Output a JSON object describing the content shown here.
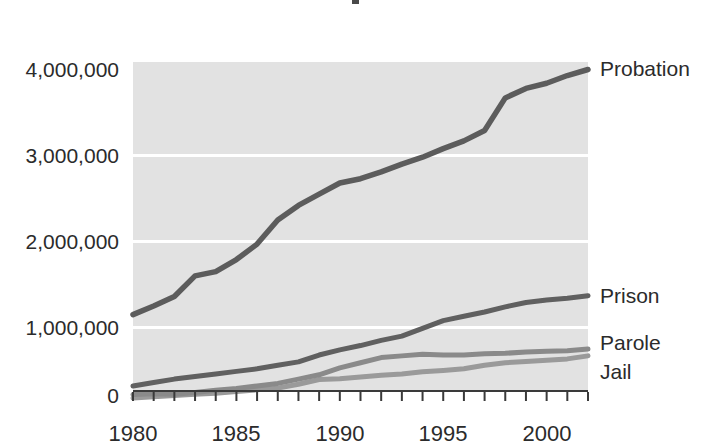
{
  "chart_data": {
    "type": "line",
    "title": "",
    "subtitle": "",
    "xlabel": "",
    "ylabel": "",
    "xlim": [
      1980,
      2002
    ],
    "ylim": [
      0,
      4200000
    ],
    "grid": true,
    "legend_position": "right-of-lines",
    "y_tick_labels": [
      "4,000,000",
      "3,000,000",
      "2,000,000",
      "1,000,000",
      "0"
    ],
    "y_tick_values": [
      4000000,
      3000000,
      2000000,
      1000000,
      0
    ],
    "x_tick_labels": [
      "1980",
      "1985",
      "1990",
      "1995",
      "2000"
    ],
    "x_tick_values": [
      1980,
      1985,
      1990,
      1995,
      2000
    ],
    "x_minor_ticks": [
      1980,
      1981,
      1982,
      1983,
      1984,
      1985,
      1986,
      1987,
      1988,
      1989,
      1990,
      1991,
      1992,
      1993,
      1994,
      1995,
      1996,
      1997,
      1998,
      1999,
      2000,
      2001,
      2002
    ],
    "x": [
      1980,
      1981,
      1982,
      1983,
      1984,
      1985,
      1986,
      1987,
      1988,
      1989,
      1990,
      1991,
      1992,
      1993,
      1994,
      1995,
      1996,
      1997,
      1998,
      1999,
      2000,
      2001,
      2002
    ],
    "series": [
      {
        "name": "Probation",
        "label": "Probation",
        "color": "#5c5c5c",
        "values": [
          1150000,
          1250000,
          1360000,
          1600000,
          1650000,
          1790000,
          1970000,
          2250000,
          2420000,
          2550000,
          2680000,
          2730000,
          2810000,
          2900000,
          2980000,
          3080000,
          3170000,
          3290000,
          3670000,
          3780000,
          3840000,
          3930000,
          4000000
        ]
      },
      {
        "name": "Prison",
        "label": "Prison",
        "color": "#606060",
        "values": [
          320000,
          360000,
          400000,
          430000,
          460000,
          490000,
          520000,
          560000,
          600000,
          680000,
          740000,
          790000,
          850000,
          900000,
          990000,
          1080000,
          1130000,
          1180000,
          1240000,
          1290000,
          1320000,
          1340000,
          1370000
        ]
      },
      {
        "name": "Parole",
        "label": "Parole",
        "color": "#8a8a8a",
        "values": [
          220000,
          230000,
          225000,
          245000,
          270000,
          290000,
          320000,
          350000,
          400000,
          450000,
          530000,
          590000,
          650000,
          670000,
          690000,
          680000,
          680000,
          695000,
          700000,
          715000,
          725000,
          730000,
          750000
        ]
      },
      {
        "name": "Jail",
        "label": "Jail",
        "color": "#9a9a9a",
        "values": [
          180000,
          195000,
          210000,
          225000,
          235000,
          255000,
          275000,
          295000,
          340000,
          395000,
          405000,
          425000,
          445000,
          460000,
          485000,
          500000,
          520000,
          560000,
          590000,
          605000,
          620000,
          635000,
          670000
        ]
      }
    ]
  },
  "labels": {
    "probation": "Probation",
    "prison": "Prison",
    "parole": "Parole",
    "jail": "Jail",
    "y0": "4,000,000",
    "y1": "3,000,000",
    "y2": "2,000,000",
    "y3": "1,000,000",
    "y4": "0",
    "x0": "1980",
    "x1": "1985",
    "x2": "1990",
    "x3": "1995",
    "x4": "2000"
  }
}
